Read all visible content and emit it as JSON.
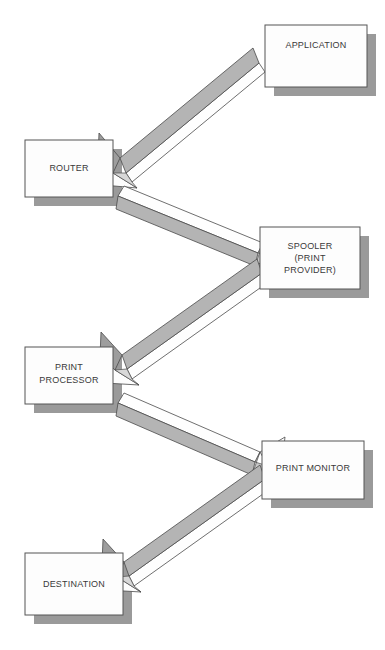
{
  "diagram": {
    "type": "flow-diagram",
    "background_color": "#ffffff",
    "style": {
      "box_fill": "#fdfdfd",
      "box_stroke": "#555555",
      "shadow_color": "#9a9a9a",
      "arrow_light": "#fefefe",
      "arrow_mid": "#b4b4b4",
      "arrow_dark": "#8e8e8e",
      "arrow_stroke": "#4a4a4a",
      "text_color": "#3a3a3a"
    },
    "nodes": [
      {
        "id": "application",
        "lines": [
          "APPLICATION"
        ],
        "x": 265,
        "y": 25,
        "w": 102,
        "h": 62,
        "label_x": 316,
        "label_y": 46
      },
      {
        "id": "router",
        "lines": [
          "ROUTER"
        ],
        "x": 25,
        "y": 140,
        "w": 88,
        "h": 57,
        "label_x": 69,
        "label_y": 169
      },
      {
        "id": "spooler",
        "lines": [
          "SPOOLER",
          "(PRINT",
          "PROVIDER)"
        ],
        "x": 260,
        "y": 227,
        "w": 100,
        "h": 62,
        "label_x": 310,
        "label_y": 247
      },
      {
        "id": "print-processor",
        "lines": [
          "PRINT",
          "PROCESSOR"
        ],
        "x": 25,
        "y": 347,
        "w": 88,
        "h": 57,
        "label_x": 69,
        "label_y": 368
      },
      {
        "id": "print-monitor",
        "lines": [
          "PRINT MONITOR"
        ],
        "x": 262,
        "y": 441,
        "w": 102,
        "h": 58,
        "label_x": 313,
        "label_y": 469
      },
      {
        "id": "destination",
        "lines": [
          "DESTINATION"
        ],
        "x": 25,
        "y": 553,
        "w": 98,
        "h": 62,
        "label_x": 74,
        "label_y": 585
      }
    ],
    "arrows": [
      {
        "id": "application-to-router",
        "from": "application",
        "to": "router",
        "direction": "down-left"
      },
      {
        "id": "router-to-spooler",
        "from": "router",
        "to": "spooler",
        "direction": "down-right"
      },
      {
        "id": "spooler-to-print-processor",
        "from": "spooler",
        "to": "print-processor",
        "direction": "down-left"
      },
      {
        "id": "print-processor-to-print-monitor",
        "from": "print-processor",
        "to": "print-monitor",
        "direction": "down-right"
      },
      {
        "id": "print-monitor-to-destination",
        "from": "print-monitor",
        "to": "destination",
        "direction": "down-left"
      }
    ]
  }
}
